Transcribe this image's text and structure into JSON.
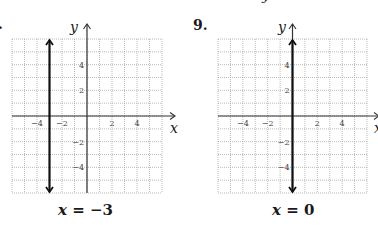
{
  "page": {
    "top_fragment": "y",
    "left_problem_number": ".",
    "right_problem_number": "9."
  },
  "chart_data": [
    {
      "type": "line",
      "title": "",
      "problem_number": "8",
      "caption": {
        "var": "x",
        "rest": " = −3"
      },
      "equation": "x = -3",
      "xlabel": "x",
      "ylabel": "y",
      "xlim": [
        -6,
        6
      ],
      "ylim": [
        -6,
        6
      ],
      "grid": true,
      "grid_step": 1,
      "x_ticks": [
        -4,
        -2,
        2,
        4
      ],
      "x_tick_labels": [
        "−4",
        "−2",
        "2",
        "4"
      ],
      "y_ticks": [
        4,
        2,
        -2,
        -4
      ],
      "y_tick_labels": [
        "4",
        "2",
        "−2",
        "−4"
      ],
      "series": [
        {
          "name": "x = -3",
          "kind": "vertical line",
          "x": [
            -3,
            -3
          ],
          "y": [
            -6,
            6
          ],
          "arrows": "both"
        }
      ]
    },
    {
      "type": "line",
      "title": "",
      "problem_number": "9",
      "caption": {
        "var": "x",
        "rest": " = 0"
      },
      "equation": "x = 0",
      "xlabel": "x",
      "ylabel": "y",
      "xlim": [
        -6,
        6
      ],
      "ylim": [
        -6,
        6
      ],
      "grid": true,
      "grid_step": 1,
      "x_ticks": [
        -4,
        -2,
        2,
        4
      ],
      "x_tick_labels": [
        "−4",
        "−2",
        "2",
        "4"
      ],
      "y_ticks": [
        4,
        2,
        -2,
        -4
      ],
      "y_tick_labels": [
        "4",
        "2",
        "−2",
        "−4"
      ],
      "series": [
        {
          "name": "x = 0",
          "kind": "vertical line",
          "x": [
            0,
            0
          ],
          "y": [
            -6,
            6
          ],
          "arrows": "both"
        }
      ]
    }
  ],
  "colors": {
    "grid": "#a8a8a8",
    "axis": "#333333",
    "line": "#111111",
    "text": "#1a1a1a"
  }
}
